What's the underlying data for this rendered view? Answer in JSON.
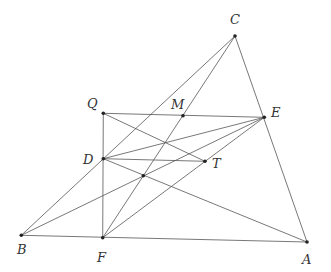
{
  "diagram": {
    "type": "geometry",
    "points": {
      "A": {
        "x": 307,
        "y": 242,
        "label": "A",
        "lx": 302,
        "ly": 264
      },
      "B": {
        "x": 21.3,
        "y": 235.3,
        "label": "B",
        "lx": 17,
        "ly": 254
      },
      "C": {
        "x": 235,
        "y": 36,
        "label": "C",
        "lx": 230,
        "ly": 24
      },
      "D": {
        "x": 103.3,
        "y": 158.7,
        "label": "D",
        "lx": 83,
        "ly": 164
      },
      "E": {
        "x": 264.3,
        "y": 117.3,
        "label": "E",
        "lx": 271,
        "ly": 117
      },
      "F": {
        "x": 102.7,
        "y": 237.7,
        "label": "F",
        "lx": 97,
        "ly": 262
      },
      "M": {
        "x": 183,
        "y": 115.7,
        "label": "M",
        "lx": 171,
        "ly": 109
      },
      "Q": {
        "x": 103.3,
        "y": 113.3,
        "label": "Q",
        "lx": 87,
        "ly": 108
      },
      "T": {
        "x": 205,
        "y": 161.3,
        "label": "T",
        "lx": 212,
        "ly": 168
      },
      "P": {
        "x": 143.3,
        "y": 175.7,
        "label": ""
      }
    },
    "segments": [
      [
        "B",
        "C"
      ],
      [
        "C",
        "A"
      ],
      [
        "B",
        "A"
      ],
      [
        "F",
        "C"
      ],
      [
        "Q",
        "E"
      ],
      [
        "Q",
        "F"
      ],
      [
        "Q",
        "T"
      ],
      [
        "D",
        "E"
      ],
      [
        "D",
        "T"
      ],
      [
        "D",
        "A"
      ],
      [
        "B",
        "E"
      ],
      [
        "F",
        "E"
      ]
    ],
    "labels": [
      "A",
      "B",
      "C",
      "D",
      "E",
      "F",
      "M",
      "Q",
      "T"
    ]
  }
}
